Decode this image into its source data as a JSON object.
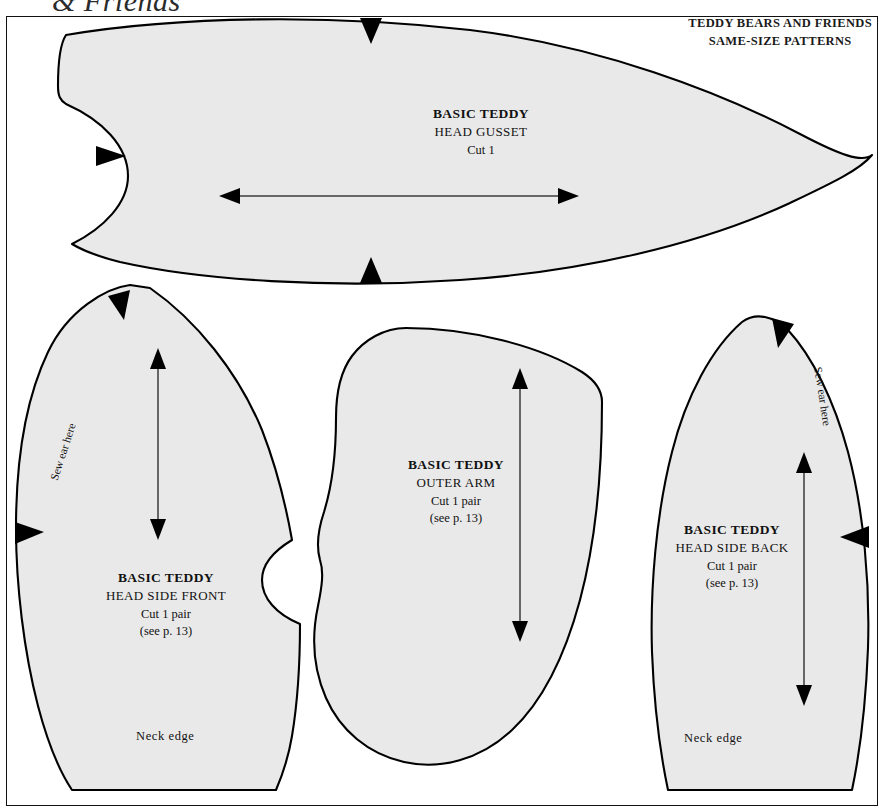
{
  "page": {
    "running_head": "& Friends",
    "header_lines": [
      "TEDDY BEARS AND FRIENDS",
      "SAME-SIZE  PATTERNS"
    ],
    "colors": {
      "piece_fill": "#e9e9e9",
      "outline": "#000000",
      "page_background": "#ffffff",
      "text": "#111111"
    }
  },
  "pieces": {
    "head_gusset": {
      "title": "BASIC TEDDY",
      "name": "HEAD GUSSET",
      "cut": "Cut 1",
      "page_ref": ""
    },
    "head_side_front": {
      "title": "BASIC TEDDY",
      "name": "HEAD SIDE FRONT",
      "cut": "Cut 1 pair",
      "page_ref": "(see p. 13)",
      "sew_ear": "Sew ear here",
      "neck_edge": "Neck edge"
    },
    "outer_arm": {
      "title": "BASIC TEDDY",
      "name": "OUTER ARM",
      "cut": "Cut 1 pair",
      "page_ref": "(see p. 13)"
    },
    "head_side_back": {
      "title": "BASIC TEDDY",
      "name": "HEAD SIDE BACK",
      "cut": "Cut 1 pair",
      "page_ref": "(see p. 13)",
      "sew_ear": "Sew ear here",
      "neck_edge": "Neck edge"
    }
  }
}
